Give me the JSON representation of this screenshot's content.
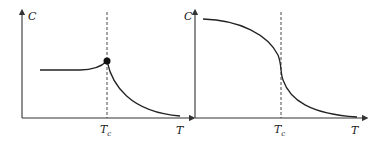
{
  "panels": [
    {
      "id": "left",
      "y_axis_label": "C",
      "x_axis_label": "T",
      "critical_label": "T",
      "critical_sub": "c",
      "description": "Heat capacity with finite cusp (peak marked by dot) at Tc, decaying above Tc"
    },
    {
      "id": "right",
      "y_axis_label": "C",
      "x_axis_label": "T",
      "critical_label": "T",
      "critical_sub": "c",
      "description": "Decreasing S-shaped curve with inflection at Tc"
    }
  ],
  "colors": {
    "line": "#222222",
    "background": "#ffffff"
  }
}
